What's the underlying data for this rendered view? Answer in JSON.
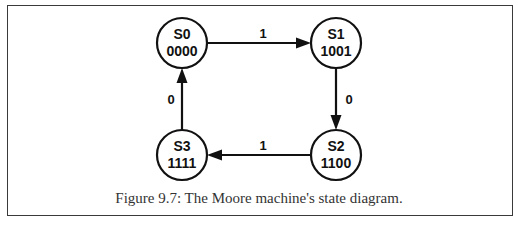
{
  "figure": {
    "caption": "Figure 9.7: The Moore machine's state diagram.",
    "border_color": "#3a3a3a"
  },
  "states": [
    {
      "id": "S0",
      "name": "S0",
      "output": "0000",
      "cx": 182,
      "cy": 43
    },
    {
      "id": "S1",
      "name": "S1",
      "output": "1001",
      "cx": 336,
      "cy": 43
    },
    {
      "id": "S2",
      "name": "S2",
      "output": "1100",
      "cx": 336,
      "cy": 155
    },
    {
      "id": "S3",
      "name": "S3",
      "output": "1111",
      "cx": 182,
      "cy": 155
    }
  ],
  "transitions": [
    {
      "from": "S0",
      "to": "S1",
      "label": "1"
    },
    {
      "from": "S1",
      "to": "S2",
      "label": "0"
    },
    {
      "from": "S2",
      "to": "S3",
      "label": "1"
    },
    {
      "from": "S3",
      "to": "S0",
      "label": "0"
    }
  ],
  "colors": {
    "stroke": "#111111",
    "background": "#ffffff",
    "caption_text": "#333333"
  }
}
